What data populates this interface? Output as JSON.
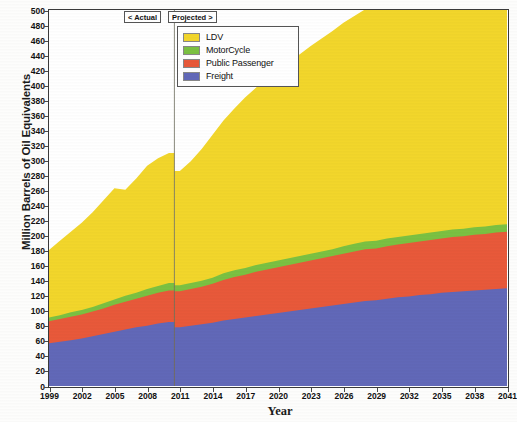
{
  "chart_data": {
    "type": "area",
    "stacked": true,
    "title": "",
    "xlabel": "Year",
    "ylabel": "Million Barrels of Oil Equivalents",
    "xlim": [
      1999,
      2041
    ],
    "ylim": [
      0,
      500
    ],
    "ytick_step": 20,
    "xtick_step": 3,
    "grid": false,
    "legend_position": "top-center",
    "yticks": [
      0,
      20,
      40,
      60,
      80,
      100,
      120,
      140,
      160,
      180,
      200,
      220,
      240,
      260,
      280,
      300,
      320,
      340,
      360,
      380,
      400,
      420,
      440,
      460,
      480,
      500
    ],
    "xticks": [
      1999,
      2002,
      2005,
      2008,
      2011,
      2014,
      2017,
      2020,
      2023,
      2026,
      2029,
      2032,
      2035,
      2038,
      2041
    ],
    "x": [
      1999,
      2000,
      2001,
      2002,
      2003,
      2004,
      2005,
      2006,
      2007,
      2008,
      2009,
      2010,
      2011,
      2012,
      2013,
      2014,
      2015,
      2016,
      2017,
      2018,
      2019,
      2020,
      2021,
      2022,
      2023,
      2024,
      2025,
      2026,
      2027,
      2028,
      2029,
      2030,
      2031,
      2032,
      2033,
      2034,
      2035,
      2036,
      2037,
      2038,
      2039,
      2040,
      2041
    ],
    "series": [
      {
        "name": "Freight",
        "color": "#6168B8",
        "values": [
          57,
          59,
          61,
          63,
          66,
          69,
          72,
          75,
          78,
          80,
          83,
          85,
          78,
          80,
          82,
          84,
          87,
          89,
          91,
          93,
          95,
          97,
          99,
          101,
          103,
          105,
          107,
          109,
          111,
          113,
          114,
          116,
          118,
          119,
          121,
          122,
          124,
          125,
          126,
          127,
          128,
          129,
          130
        ]
      },
      {
        "name": "Public Passenger",
        "color": "#E8593A",
        "values": [
          29,
          30,
          31,
          32,
          33,
          34,
          36,
          37,
          38,
          40,
          41,
          42,
          48,
          49,
          50,
          52,
          54,
          56,
          57,
          59,
          60,
          61,
          62,
          63,
          64,
          65,
          66,
          67,
          68,
          69,
          69,
          70,
          70,
          71,
          71,
          72,
          72,
          73,
          73,
          74,
          74,
          75,
          75
        ]
      },
      {
        "name": "MotorCycle",
        "color": "#7BC142",
        "values": [
          5,
          5,
          6,
          6,
          6,
          7,
          7,
          8,
          8,
          9,
          9,
          10,
          8,
          8,
          8,
          8,
          9,
          9,
          9,
          9,
          9,
          9,
          9,
          9,
          9,
          9,
          9,
          10,
          10,
          10,
          10,
          10,
          10,
          10,
          10,
          10,
          10,
          10,
          10,
          10,
          10,
          10,
          10
        ]
      },
      {
        "name": "LDV",
        "color": "#F2D62B",
        "values": [
          90,
          99,
          107,
          116,
          126,
          137,
          148,
          141,
          152,
          164,
          170,
          173,
          152,
          162,
          175,
          190,
          203,
          215,
          227,
          236,
          245,
          253,
          261,
          268,
          276,
          283,
          290,
          297,
          303,
          309,
          316,
          322,
          328,
          333,
          339,
          344,
          350,
          355,
          360,
          365,
          370,
          378,
          385
        ]
      }
    ],
    "totals_note": "stacked order bottom to top: Freight, Public Passenger, MotorCycle, LDV",
    "annotations": [
      {
        "name": "actual-phase",
        "label": "< Actual",
        "x_range": [
          1999,
          2010.5
        ]
      },
      {
        "name": "projected-phase",
        "label": "Projected >",
        "x_range": [
          2010.5,
          2041
        ]
      }
    ],
    "divider_year": 2010.5
  },
  "legend": {
    "items": [
      {
        "label": "LDV",
        "color": "#F2D62B"
      },
      {
        "label": "MotorCycle",
        "color": "#7BC142"
      },
      {
        "label": "Public Passenger",
        "color": "#E8593A"
      },
      {
        "label": "Freight",
        "color": "#6168B8"
      }
    ]
  },
  "phase_labels": {
    "actual": "< Actual",
    "projected": "Projected >"
  },
  "axes": {
    "y_title": "Million Barrels of Oil Equivalents",
    "x_title": "Year"
  }
}
